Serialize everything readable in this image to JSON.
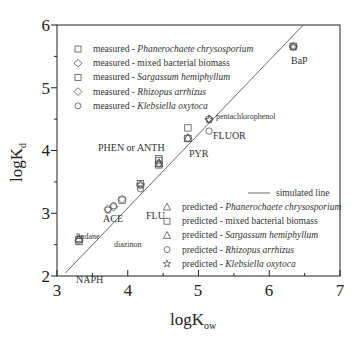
{
  "chart_data": {
    "type": "scatter",
    "title": "",
    "xlabel": "logK_ow",
    "ylabel": "logK_d",
    "xlim": [
      3,
      7
    ],
    "ylim": [
      2,
      6
    ],
    "xticks": [
      3,
      4,
      5,
      6,
      7
    ],
    "yticks": [
      2,
      3,
      4,
      5,
      6
    ],
    "grid": false,
    "legend_position": "upper-left (measured), lower-right (predicted, simulated line)",
    "simulated_line": {
      "name": "simulated line",
      "x": [
        3.12,
        6.48
      ],
      "y": [
        2.05,
        6.0
      ]
    },
    "series": [
      {
        "name": "measured - Phanerochaete chrysosporium",
        "marker": "square",
        "group": "measured",
        "points": [
          {
            "x": 4.44,
            "y": 3.87
          },
          {
            "x": 4.85,
            "y": 4.36
          }
        ]
      },
      {
        "name": "measured - mixed bacterial biomass",
        "marker": "diamond",
        "group": "measured",
        "points": [
          {
            "x": 3.31,
            "y": 2.57
          },
          {
            "x": 3.92,
            "y": 3.22
          },
          {
            "x": 4.18,
            "y": 3.45
          },
          {
            "x": 4.44,
            "y": 3.8
          },
          {
            "x": 4.85,
            "y": 4.2
          },
          {
            "x": 6.34,
            "y": 5.65
          }
        ]
      },
      {
        "name": "measured - Sargassum hemiphyllum",
        "marker": "square",
        "group": "measured",
        "points": [
          {
            "x": 3.31,
            "y": 2.55
          },
          {
            "x": 4.44,
            "y": 3.84
          }
        ]
      },
      {
        "name": "measured - Rhizopus arrhizus",
        "marker": "diamond",
        "group": "measured",
        "points": [
          {
            "x": 3.72,
            "y": 3.07
          },
          {
            "x": 3.8,
            "y": 3.1
          },
          {
            "x": 5.15,
            "y": 4.5
          }
        ]
      },
      {
        "name": "measured - Klebsiella oxytoca",
        "marker": "circle",
        "group": "measured",
        "points": [
          {
            "x": 4.18,
            "y": 3.39
          },
          {
            "x": 5.15,
            "y": 4.31
          },
          {
            "x": 6.34,
            "y": 5.66
          }
        ]
      },
      {
        "name": "predicted - Phanerochaete chrysosporium",
        "marker": "triangle",
        "group": "predicted",
        "points": [
          {
            "x": 4.44,
            "y": 3.79
          },
          {
            "x": 4.85,
            "y": 4.2
          }
        ]
      },
      {
        "name": "predicted - mixed bacterial biomass",
        "marker": "square",
        "group": "predicted",
        "points": [
          {
            "x": 3.31,
            "y": 2.58
          },
          {
            "x": 3.92,
            "y": 3.21
          },
          {
            "x": 4.18,
            "y": 3.47
          },
          {
            "x": 4.44,
            "y": 3.77
          },
          {
            "x": 4.85,
            "y": 4.19
          },
          {
            "x": 6.34,
            "y": 5.66
          }
        ]
      },
      {
        "name": "predicted - Sargassum hemiphyllum",
        "marker": "triangle",
        "group": "predicted",
        "points": [
          {
            "x": 3.31,
            "y": 2.6
          },
          {
            "x": 4.44,
            "y": 3.8
          }
        ]
      },
      {
        "name": "predicted - Rhizopus arrhizus",
        "marker": "circle",
        "group": "predicted",
        "points": [
          {
            "x": 3.72,
            "y": 3.05
          },
          {
            "x": 3.8,
            "y": 3.12
          },
          {
            "x": 5.15,
            "y": 4.5
          }
        ]
      },
      {
        "name": "predicted - Klebsiella oxytoca",
        "marker": "star",
        "group": "predicted",
        "points": [
          {
            "x": 4.18,
            "y": 3.45
          },
          {
            "x": 5.15,
            "y": 4.49
          },
          {
            "x": 6.34,
            "y": 5.65
          }
        ]
      }
    ],
    "annotations": [
      {
        "text": "NAPH",
        "x": 3.31,
        "y": 2.57
      },
      {
        "text": "lindane",
        "x": 3.72,
        "y": 3.07
      },
      {
        "text": "diazinon",
        "x": 3.8,
        "y": 3.1
      },
      {
        "text": "ACE",
        "x": 3.92,
        "y": 3.22
      },
      {
        "text": "FLU",
        "x": 4.18,
        "y": 3.45
      },
      {
        "text": "PHEN or ANTH",
        "x": 4.44,
        "y": 3.8
      },
      {
        "text": "PYR",
        "x": 4.85,
        "y": 4.2
      },
      {
        "text": "pentachlorophenol",
        "x": 5.15,
        "y": 4.5
      },
      {
        "text": "FLUOR",
        "x": 5.15,
        "y": 4.31
      },
      {
        "text": "BaP",
        "x": 6.34,
        "y": 5.65
      }
    ]
  },
  "axes": {
    "x_title_main": "logK",
    "x_title_sub": "ow",
    "y_title_main": "logK",
    "y_title_sub": "d",
    "x_tick_labels": [
      "3",
      "4",
      "5",
      "6",
      "7"
    ],
    "y_tick_labels": [
      "2",
      "3",
      "4",
      "5",
      "6"
    ]
  },
  "legend_measured": {
    "items": [
      {
        "prefix": "measured - ",
        "species": "Phanerochaete chrysosporium",
        "italic": true,
        "marker": "square"
      },
      {
        "prefix": "measured - ",
        "species": "mixed bacterial biomass",
        "italic": false,
        "marker": "diamond"
      },
      {
        "prefix": "measured - ",
        "species": "Sargassum hemiphyllum",
        "italic": true,
        "marker": "square"
      },
      {
        "prefix": "measured - ",
        "species": "Rhizopus arrhizus",
        "italic": true,
        "marker": "diamond"
      },
      {
        "prefix": "measured - ",
        "species": "Klebsiella oxytoca",
        "italic": true,
        "marker": "circle"
      }
    ]
  },
  "legend_line": {
    "label": "simulated line"
  },
  "legend_predicted": {
    "items": [
      {
        "prefix": "predicted  - ",
        "species": "Phanerochaete chrysosporium",
        "italic": true,
        "marker": "triangle"
      },
      {
        "prefix": "predicted  - ",
        "species": "mixed bacterial biomass",
        "italic": false,
        "marker": "square"
      },
      {
        "prefix": "predicted  - ",
        "species": "Sargassum hemiphyllum",
        "italic": true,
        "marker": "triangle"
      },
      {
        "prefix": "predicted  - ",
        "species": "Rhizopus arrhizus",
        "italic": true,
        "marker": "circle"
      },
      {
        "prefix": "predicted  - ",
        "species": "Klebsiella oxytoca",
        "italic": true,
        "marker": "star"
      }
    ]
  },
  "colors": {
    "axis": "#222222",
    "marker": "#555555",
    "line": "#444444",
    "text": "#333333"
  }
}
